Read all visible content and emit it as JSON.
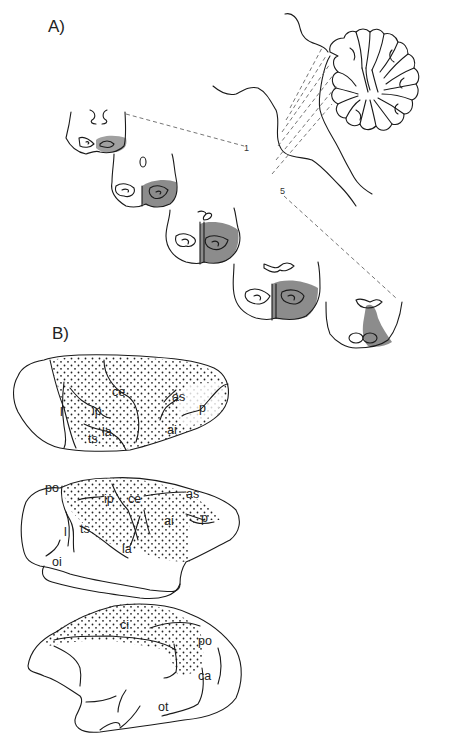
{
  "figure": {
    "panels": [
      {
        "id": "A",
        "label": "A)",
        "description": "Cerebellum lateral view with five coronal brainstem/cerebellar sections",
        "section_markers": {
          "first": "1",
          "last": "5"
        },
        "section_count": 5
      },
      {
        "id": "B",
        "label": "B)",
        "description": "Three views of macaque cerebral hemisphere with stippled projection territory",
        "views": [
          {
            "name": "dorsolateral",
            "sulci": [
              "ce",
              "as",
              "ip",
              "p",
              "l",
              "ai",
              "ts",
              "la"
            ]
          },
          {
            "name": "lateral",
            "sulci": [
              "po",
              "ip",
              "ce",
              "as",
              "ai",
              "p",
              "l",
              "ts",
              "la",
              "oi"
            ]
          },
          {
            "name": "medial",
            "sulci": [
              "ci",
              "po",
              "ca",
              "ot"
            ]
          }
        ]
      }
    ]
  },
  "labels": {
    "panel_a": "A)",
    "panel_b": "B)",
    "marker_1": "1",
    "marker_5": "5",
    "v1": {
      "ce": "ce",
      "as": "as",
      "ip": "ip",
      "p": "p",
      "l": "l",
      "ai": "ai",
      "ts": "ts",
      "la": "la"
    },
    "v2": {
      "po": "po",
      "ip": "ip",
      "ce": "ce",
      "as": "as",
      "ai": "ai",
      "p": "p",
      "l": "l",
      "ts": "ts",
      "la": "la",
      "oi": "oi"
    },
    "v3": {
      "ci": "ci",
      "po": "po",
      "ca": "ca",
      "ot": "ot"
    }
  },
  "colors": {
    "ink": "#1a1a1a",
    "shade": "#8c8c8c",
    "dash": "#666666",
    "background": "#ffffff"
  }
}
